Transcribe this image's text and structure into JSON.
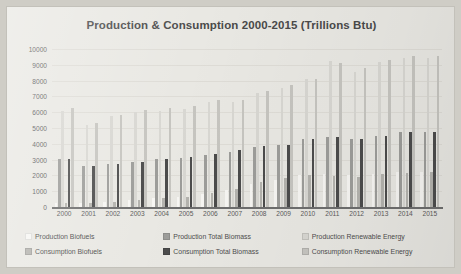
{
  "chart_data": {
    "type": "bar",
    "title": "Production & Consumption 2000-2015 (Trillions Btu)",
    "xlabel": "",
    "ylabel": "",
    "ylim": [
      0,
      10000
    ],
    "ytick_step": 1000,
    "grid": true,
    "legend_position": "bottom",
    "yticks": [
      "10000",
      "9000",
      "8000",
      "7000",
      "6000",
      "5000",
      "4000",
      "3000",
      "2000",
      "1000",
      "0"
    ],
    "categories": [
      "2000",
      "2001",
      "2002",
      "2003",
      "2004",
      "2005",
      "2006",
      "2007",
      "2008",
      "2009",
      "2010",
      "2011",
      "2012",
      "2013",
      "2014",
      "2015"
    ],
    "series": [
      {
        "name": "Production Biofuels",
        "color": "#f7f6f3",
        "values": [
          230,
          260,
          340,
          420,
          540,
          620,
          830,
          1070,
          1460,
          1720,
          2000,
          2060,
          2020,
          2100,
          2200,
          2200
        ]
      },
      {
        "name": "Production Total Biomass",
        "color": "#9d9d9a",
        "values": [
          3010,
          2620,
          2700,
          2820,
          3010,
          3130,
          3280,
          3500,
          3830,
          3900,
          4300,
          4410,
          4310,
          4500,
          4750,
          4750
        ]
      },
      {
        "name": "Production Renewable Energy",
        "color": "#d8d7d2",
        "values": [
          6100,
          5160,
          5790,
          6010,
          6090,
          6230,
          6630,
          6660,
          7190,
          7560,
          8090,
          9210,
          8560,
          9160,
          9430,
          9460
        ]
      },
      {
        "name": "Consumption Biofuels",
        "color": "#b4b3ae",
        "values": [
          230,
          260,
          340,
          430,
          560,
          660,
          890,
          1170,
          1580,
          1820,
          2000,
          1940,
          1920,
          2060,
          2160,
          2190
        ]
      },
      {
        "name": "Consumption Total Biomass",
        "color": "#4c4c4c",
        "values": [
          3010,
          2620,
          2700,
          2820,
          3020,
          3150,
          3370,
          3600,
          3880,
          3920,
          4300,
          4410,
          4310,
          4500,
          4750,
          4750
        ]
      },
      {
        "name": "Consumption Renewable Energy",
        "color": "#c6c5c0",
        "values": [
          6260,
          5330,
          5840,
          6150,
          6260,
          6400,
          6790,
          6800,
          7370,
          7740,
          8090,
          9140,
          8790,
          9290,
          9580,
          9540
        ]
      }
    ]
  },
  "legend": {
    "items": [
      {
        "label": "Production Biofuels",
        "color": "#f7f6f3"
      },
      {
        "label": "Production Total Biomass",
        "color": "#9d9d9a"
      },
      {
        "label": "Production Renewable Energy",
        "color": "#d8d7d2"
      },
      {
        "label": "Consumption Biofuels",
        "color": "#b4b3ae"
      },
      {
        "label": "Consumption Total Biomass",
        "color": "#4c4c4c"
      },
      {
        "label": "Consumption Renewable Energy",
        "color": "#c6c5c0"
      }
    ]
  }
}
